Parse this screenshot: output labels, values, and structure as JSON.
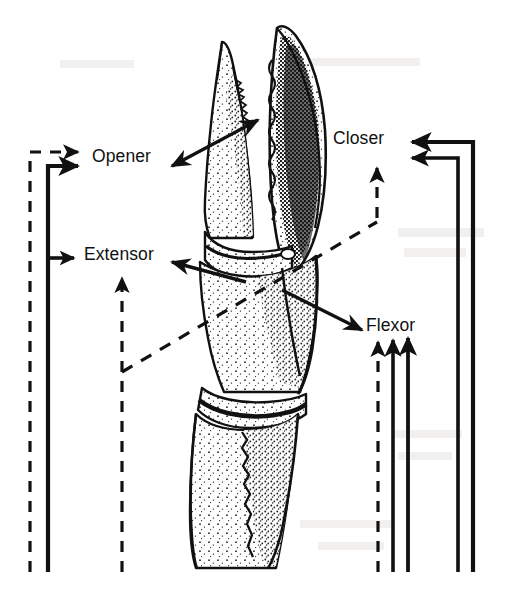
{
  "figure": {
    "background_color": "#ffffff",
    "ink_color": "#111111",
    "width": 506,
    "height": 600
  },
  "labels": {
    "opener": "Opener",
    "extensor": "Extensor",
    "closer": "Closer",
    "flexor": "Flexor"
  },
  "anatomy": {
    "specimen": "claw-limb",
    "parts": [
      {
        "name": "dactyl-movable-finger",
        "shading": "light-stipple"
      },
      {
        "name": "propus-fixed-finger",
        "shading": "dark-stipple"
      },
      {
        "name": "carpus-segment",
        "shading": "light-stipple"
      },
      {
        "name": "merus-segment",
        "shading": "light-stipple"
      }
    ]
  },
  "pointers": [
    {
      "name": "pointer-to-opener",
      "target": "opener",
      "style": "solid",
      "direction": "down-left",
      "double_headed": true
    },
    {
      "name": "pointer-to-extensor",
      "target": "extensor",
      "style": "solid",
      "direction": "left"
    },
    {
      "name": "pointer-to-flexor",
      "target": "flexor",
      "style": "solid",
      "direction": "down-right"
    }
  ],
  "pathways": {
    "left": [
      {
        "name": "dashed-outer-left",
        "style": "dashed",
        "terminates_at": "opener"
      },
      {
        "name": "solid-left",
        "style": "solid",
        "terminates_at": "opener-and-extensor"
      },
      {
        "name": "dashed-inner-left",
        "style": "dashed",
        "terminates_at": "extensor"
      }
    ],
    "right": [
      {
        "name": "dashed-flexor-arrow",
        "style": "dashed",
        "terminates_at": "flexor"
      },
      {
        "name": "solid-flexor-arrow-inner",
        "style": "solid",
        "terminates_at": "flexor"
      },
      {
        "name": "solid-flexor-arrow-outer",
        "style": "solid",
        "terminates_at": "flexor"
      },
      {
        "name": "solid-closer-inner",
        "style": "solid",
        "terminates_at": "closer"
      },
      {
        "name": "solid-closer-outer",
        "style": "solid",
        "terminates_at": "closer"
      }
    ],
    "diagonal": [
      {
        "name": "dashed-diagonal-link",
        "style": "dashed",
        "from": "extensor-branch",
        "to": "closer-branch"
      }
    ]
  }
}
